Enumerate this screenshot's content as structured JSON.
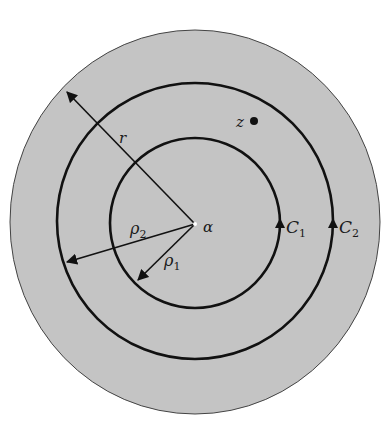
{
  "figure": {
    "type": "annulus-contour-diagram",
    "background_color": "#ffffff",
    "disk_fill": "#c4c4c4",
    "stroke_color": "#111111",
    "center": {
      "x": 195,
      "y": 222
    },
    "disk": {
      "radius": 192
    },
    "circles": [
      {
        "id": "C1",
        "radius": 86
      },
      {
        "id": "C2",
        "radius": 138
      }
    ]
  },
  "labels": {
    "center": "α",
    "point": "z",
    "radius_outer": "r",
    "rho2_base": "ρ",
    "rho2_sub": "2",
    "rho1_base": "ρ",
    "rho1_sub": "1",
    "c1_base": "C",
    "c1_sub": "1",
    "c2_base": "C",
    "c2_sub": "2"
  }
}
